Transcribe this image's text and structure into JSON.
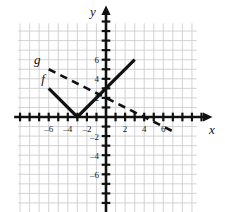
{
  "chart_data": {
    "type": "line",
    "title": "",
    "xlabel": "x",
    "ylabel": "y",
    "xlim": [
      -6.8,
      9.5
    ],
    "ylim": [
      -10,
      9.8
    ],
    "grid": true,
    "grid_step": 1,
    "grid_x_range": [
      -9.2,
      9.5
    ],
    "grid_y_range": [
      -10,
      9.8
    ],
    "legend": "inline-labels",
    "x_ticks": [
      -6,
      -4,
      -2,
      2,
      4,
      6
    ],
    "x_tick_labels": [
      "–6",
      "–4",
      "–2",
      "2",
      "4",
      "6"
    ],
    "y_ticks": [
      6,
      4,
      2,
      -2,
      -4,
      -6
    ],
    "y_tick_labels": [
      "6",
      "4",
      "2",
      "–2",
      "–4",
      "–6"
    ],
    "series": [
      {
        "name": "f",
        "label": "f",
        "style": "solid",
        "color": "#111111",
        "width": 3.2,
        "points": [
          [
            -6,
            3
          ],
          [
            -3,
            0
          ],
          [
            3,
            6
          ]
        ],
        "description": "absolute value V-shape with vertex at (-3, 0)",
        "label_position": [
          -6.6,
          3.6
        ]
      },
      {
        "name": "g",
        "label": "g",
        "style": "dashed",
        "color": "#111111",
        "width": 2.6,
        "points": [
          [
            -6,
            5
          ],
          [
            7.2,
            -1.6
          ]
        ],
        "description": "decreasing dashed line crossing x-axis near x = 4",
        "label_position": [
          -7.2,
          5.6
        ]
      }
    ],
    "axis_color": "#111111",
    "grid_color": "#c8c8cc"
  },
  "axes": {
    "x_axis_label": "x",
    "y_axis_label": "y"
  },
  "curve_labels": {
    "f": "f",
    "g": "g"
  }
}
